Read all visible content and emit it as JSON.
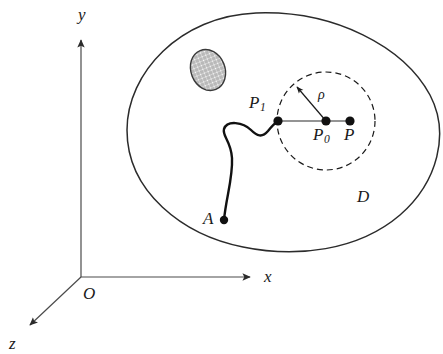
{
  "figure": {
    "colors": {
      "stroke": "#1a1a1a",
      "axis": "#3a3a3a",
      "dashed": "#1a1a1a",
      "hatch": "#808080",
      "background": "#ffffff"
    }
  },
  "axes": {
    "x_label": "x",
    "y_label": "y",
    "z_label": "z",
    "origin_label": "O"
  },
  "labels": {
    "domain": "D",
    "point_a": "A",
    "point_p1_base": "P",
    "point_p1_sub": "1",
    "point_p0_base": "P",
    "point_p0_sub": "0",
    "point_p": "P",
    "radius": "ρ"
  },
  "geometry": {
    "origin": {
      "x": 81,
      "y": 277
    },
    "x_axis_tip": {
      "x": 256,
      "y": 277
    },
    "y_axis_tip": {
      "x": 81,
      "y": 34
    },
    "z_axis_tip": {
      "x": 24,
      "y": 330
    },
    "point_a": {
      "x": 224,
      "y": 220,
      "r": 4
    },
    "point_p1": {
      "x": 278,
      "y": 121,
      "r": 4.5
    },
    "point_p0": {
      "x": 326,
      "y": 121,
      "r": 4.5
    },
    "point_p": {
      "x": 350,
      "y": 121,
      "r": 4.5
    },
    "neighbourhood_circle": {
      "cx": 326,
      "cy": 121,
      "r": 49
    },
    "rho_arrow_tip": {
      "x": 296,
      "y": 86
    },
    "hatched_blob": {
      "cx": 208,
      "cy": 70,
      "rx": 17,
      "ry": 21,
      "rotate": -22
    }
  }
}
